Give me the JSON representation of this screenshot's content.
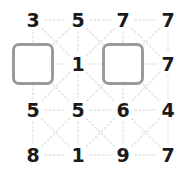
{
  "puzzle": {
    "type": "number-grid",
    "rows": 4,
    "cols": 4,
    "colors": {
      "connector_line": "#e2e2e2",
      "number_text": "#1a1a1a",
      "box_border": "#9a9a9a",
      "box_fill": "#ffffff",
      "background": "#ffffff"
    },
    "geometry": {
      "col_x": [
        33,
        78,
        123,
        168
      ],
      "row_y": [
        20,
        64,
        110,
        155
      ]
    },
    "cells": [
      {
        "row": 0,
        "col": 0,
        "kind": "number",
        "value": "3"
      },
      {
        "row": 0,
        "col": 1,
        "kind": "number",
        "value": "5"
      },
      {
        "row": 0,
        "col": 2,
        "kind": "number",
        "value": "7"
      },
      {
        "row": 0,
        "col": 3,
        "kind": "number",
        "value": "7"
      },
      {
        "row": 1,
        "col": 0,
        "kind": "box",
        "value": ""
      },
      {
        "row": 1,
        "col": 1,
        "kind": "number",
        "value": "1"
      },
      {
        "row": 1,
        "col": 2,
        "kind": "box",
        "value": ""
      },
      {
        "row": 1,
        "col": 3,
        "kind": "number",
        "value": "7"
      },
      {
        "row": 2,
        "col": 0,
        "kind": "number",
        "value": "5"
      },
      {
        "row": 2,
        "col": 1,
        "kind": "number",
        "value": "5"
      },
      {
        "row": 2,
        "col": 2,
        "kind": "number",
        "value": "6"
      },
      {
        "row": 2,
        "col": 3,
        "kind": "number",
        "value": "4"
      },
      {
        "row": 3,
        "col": 0,
        "kind": "number",
        "value": "8"
      },
      {
        "row": 3,
        "col": 1,
        "kind": "number",
        "value": "1"
      },
      {
        "row": 3,
        "col": 2,
        "kind": "number",
        "value": "9"
      },
      {
        "row": 3,
        "col": 3,
        "kind": "number",
        "value": "7"
      }
    ]
  }
}
